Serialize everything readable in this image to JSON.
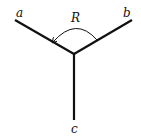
{
  "diagram": {
    "type": "three-ray junction with rotation arc",
    "colors": {
      "line": "#111111",
      "background": "#ffffff"
    },
    "center": [
      74,
      54
    ],
    "rays": [
      {
        "id": "a",
        "label": "a",
        "end": [
          15,
          20
        ],
        "label_pos": [
          19,
          17
        ]
      },
      {
        "id": "b",
        "label": "b",
        "end": [
          132,
          20
        ],
        "label_pos": [
          127,
          17
        ]
      },
      {
        "id": "c",
        "label": "c",
        "end": [
          74,
          120
        ],
        "label_pos": [
          74,
          132
        ]
      }
    ],
    "arc": {
      "label": "R",
      "label_pos": [
        76,
        22
      ],
      "from": [
        97,
        40
      ],
      "to": [
        53,
        42
      ],
      "arrow_at": "a"
    }
  }
}
